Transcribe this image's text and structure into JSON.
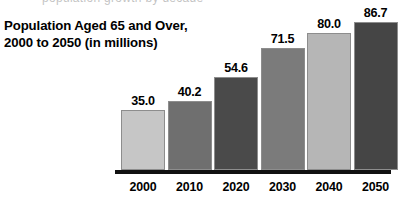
{
  "title": {
    "line1": "Population Aged 65 and Over,",
    "line2": "2000 to 2050 (in millions)"
  },
  "scan_artifact": {
    "text": "population growth by decade"
  },
  "chart_data": {
    "type": "bar",
    "title": "Population Aged 65 and Over, 2000 to 2050 (in millions)",
    "xlabel": "",
    "ylabel": "",
    "ylim": [
      0,
      95
    ],
    "grid": false,
    "legend": "none",
    "categories": [
      "2000",
      "2010",
      "2020",
      "2030",
      "2040",
      "2050"
    ],
    "values": [
      35.0,
      40.2,
      54.6,
      71.5,
      80.0,
      86.7
    ],
    "value_labels": [
      "35.0",
      "40.2",
      "54.6",
      "71.5",
      "80.0",
      "86.7"
    ],
    "bar_colors": [
      "#c6c6c6",
      "#6f6f6f",
      "#4a4a4a",
      "#7b7b7b",
      "#b6b6b6",
      "#454545"
    ],
    "bar_border_color": "#8d8d8d",
    "axis_color": "#111111",
    "background": "#ffffff",
    "units": "millions"
  }
}
